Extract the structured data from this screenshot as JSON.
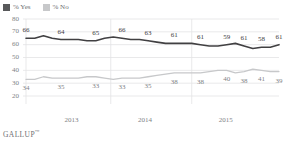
{
  "legend": {
    "items": [
      {
        "label": "% Yes",
        "color": "#58595b",
        "icon": "square-swatch-icon"
      },
      {
        "label": "% No",
        "color": "#c7c8ca",
        "icon": "square-swatch-icon"
      }
    ]
  },
  "footer": {
    "brand": "GALLUP",
    "trademark": "™"
  },
  "chart_data": {
    "type": "line",
    "title": "",
    "subtitle": "",
    "xlabel": "",
    "ylabel": "",
    "ylim": [
      20,
      80
    ],
    "yticks": [
      20,
      30,
      40,
      50,
      60,
      70,
      80
    ],
    "grid": "horizontal-and-year-dividers",
    "legend_position": "top-left",
    "x_tick_labels": [
      "2013",
      "2014",
      "2015"
    ],
    "x_tick_positions": [
      0.18,
      0.47,
      0.79
    ],
    "n_points": 30,
    "series": [
      {
        "name": "% Yes",
        "color": "#414042",
        "values": [
          65,
          65,
          67,
          65,
          64,
          64,
          64,
          63,
          63,
          65,
          66,
          65,
          64,
          64,
          63,
          62,
          61,
          61,
          61,
          61,
          60,
          59,
          59,
          60,
          61,
          59,
          57,
          58,
          58,
          60
        ],
        "labeled_points": [
          {
            "index": 0,
            "value": 66
          },
          {
            "index": 4,
            "value": 64
          },
          {
            "index": 8,
            "value": 65
          },
          {
            "index": 11,
            "value": 66
          },
          {
            "index": 14,
            "value": 63
          },
          {
            "index": 17,
            "value": 61
          },
          {
            "index": 20,
            "value": 61
          },
          {
            "index": 23,
            "value": 59
          },
          {
            "index": 25,
            "value": 61
          },
          {
            "index": 27,
            "value": 58
          },
          {
            "index": 29,
            "value": 61
          }
        ]
      },
      {
        "name": "% No",
        "color": "#c7c8ca",
        "values": [
          33,
          33,
          35,
          34,
          34,
          34,
          34,
          35,
          35,
          34,
          33,
          34,
          34,
          34,
          35,
          36,
          37,
          38,
          38,
          38,
          38,
          39,
          40,
          40,
          38,
          39,
          41,
          40,
          39,
          39
        ],
        "labeled_points": [
          {
            "index": 0,
            "value": 34
          },
          {
            "index": 4,
            "value": 35
          },
          {
            "index": 8,
            "value": 33
          },
          {
            "index": 11,
            "value": 33
          },
          {
            "index": 14,
            "value": 35
          },
          {
            "index": 17,
            "value": 38
          },
          {
            "index": 20,
            "value": 38
          },
          {
            "index": 23,
            "value": 40
          },
          {
            "index": 25,
            "value": 38
          },
          {
            "index": 27,
            "value": 41
          },
          {
            "index": 29,
            "value": 39
          }
        ]
      }
    ]
  }
}
